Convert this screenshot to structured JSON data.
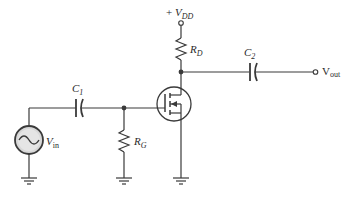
{
  "diagram": {
    "type": "common-source MOSFET amplifier schematic",
    "labels": {
      "vdd": {
        "prefix": "+ ",
        "main": "V",
        "sub": "DD"
      },
      "rd": {
        "main": "R",
        "sub": "D"
      },
      "c2": {
        "main": "C",
        "sub": "2"
      },
      "vout": {
        "main": "V",
        "sub": "out"
      },
      "c1": {
        "main": "C",
        "sub": "1"
      },
      "rg": {
        "main": "R",
        "sub": "G"
      },
      "vin": {
        "main": "V",
        "sub": "in"
      }
    },
    "components": [
      "V_DD supply terminal",
      "R_D drain resistor",
      "C_2 output coupling capacitor",
      "V_out output terminal",
      "C_1 input coupling capacitor",
      "R_G gate resistor",
      "V_in AC signal source",
      "n-channel E-MOSFET",
      "ground symbols (3)"
    ],
    "colors": {
      "line": "#3a3a3a",
      "source_fill": "#d8d8d8",
      "background": "#ffffff"
    }
  }
}
